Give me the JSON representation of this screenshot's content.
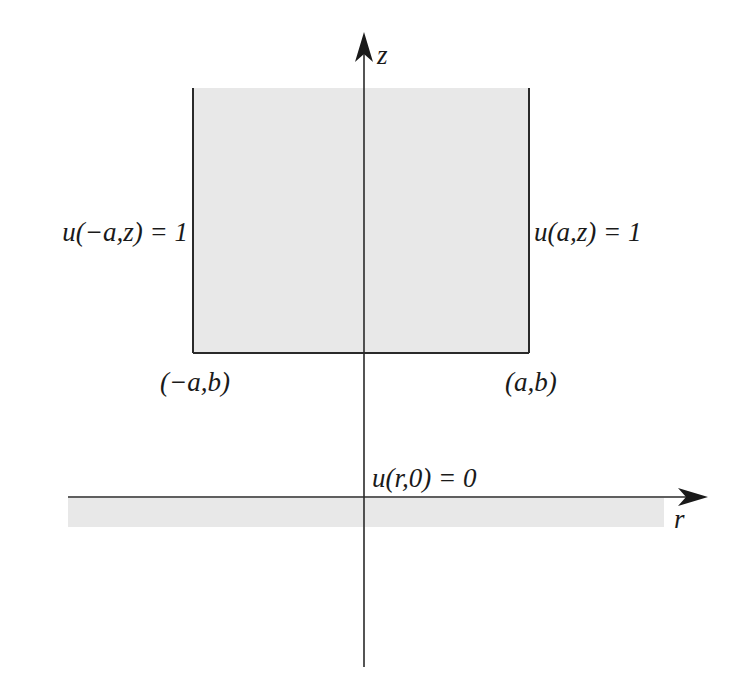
{
  "diagram": {
    "axes": {
      "z_label": "z",
      "r_label": "r"
    },
    "labels": {
      "left_boundary": "u(−a,z) = 1",
      "right_boundary": "u(a,z) = 1",
      "bottom_left_corner": "(−a,b)",
      "bottom_right_corner": "(a,b)",
      "bottom_boundary": "u(r,0) = 0"
    },
    "colors": {
      "fill": "#e8e8e8",
      "line": "#2a2a2a",
      "background": "#ffffff"
    }
  }
}
